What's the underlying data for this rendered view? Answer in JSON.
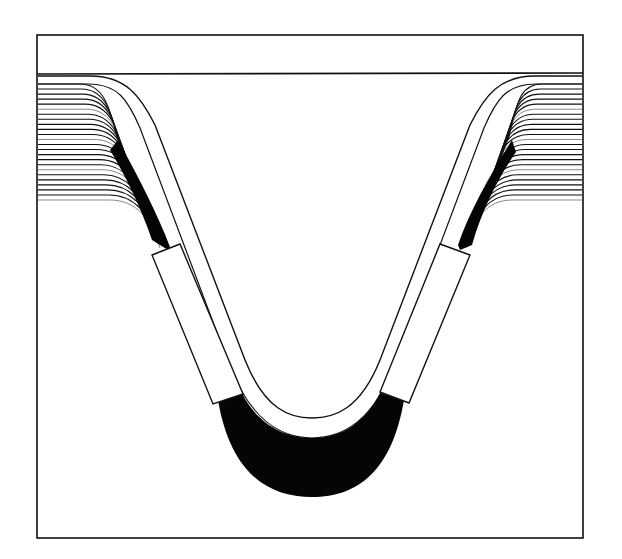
{
  "canvas": {
    "width": 622,
    "height": 559,
    "background": "#ffffff"
  },
  "colors": {
    "ink": "#111111",
    "fill_dark": "#050505",
    "paper": "#ffffff"
  },
  "frame": {
    "x": 37,
    "y": 35,
    "width": 546,
    "height": 503,
    "top_band_line_y": 74
  },
  "diagram": {
    "strata_line_count": 24,
    "left_strata": {
      "x_start": 38,
      "y_top": 84,
      "y_bottom": 200
    },
    "right_strata": {
      "x_end": 582,
      "y_top": 84,
      "y_bottom": 200
    },
    "left_block": {
      "label": "",
      "corners": [
        [
          152,
          255
        ],
        [
          180,
          244
        ],
        [
          243,
          394
        ],
        [
          213,
          404
        ]
      ]
    },
    "right_block": {
      "label": "",
      "corners": [
        [
          440,
          244
        ],
        [
          470,
          255
        ],
        [
          409,
          403
        ],
        [
          380,
          392
        ]
      ]
    }
  }
}
